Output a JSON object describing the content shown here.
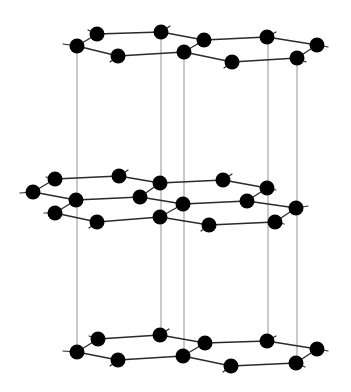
{
  "diagram": {
    "width": 351,
    "height": 392,
    "colors": {
      "background": "#ffffff",
      "atom": "#000000",
      "bond": "#2a2a2a",
      "vertical_line": "#b4b4b4"
    },
    "atom_radius": 7.5,
    "vertical_lines": [
      {
        "x": 77,
        "y1": 46,
        "y2": 352
      },
      {
        "x": 161,
        "y1": 32,
        "y2": 335
      },
      {
        "x": 184,
        "y1": 52,
        "y2": 356
      },
      {
        "x": 268,
        "y1": 37,
        "y2": 341
      },
      {
        "x": 297,
        "y1": 58,
        "y2": 363
      }
    ],
    "layers": [
      {
        "name": "top-layer",
        "atoms": [
          [
            77,
            46
          ],
          [
            97,
            34
          ],
          [
            118,
            56
          ],
          [
            161,
            32
          ],
          [
            184,
            52
          ],
          [
            204,
            40
          ],
          [
            232,
            62
          ],
          [
            267,
            37
          ],
          [
            297,
            58
          ],
          [
            317,
            45
          ]
        ],
        "bonds": [
          [
            0,
            1
          ],
          [
            1,
            3
          ],
          [
            3,
            5
          ],
          [
            5,
            7
          ],
          [
            7,
            9
          ],
          [
            0,
            2
          ],
          [
            2,
            4
          ],
          [
            4,
            6
          ],
          [
            6,
            8
          ],
          [
            8,
            9
          ],
          [
            4,
            5
          ]
        ],
        "stubs": [
          [
            77,
            46,
            63,
            44
          ],
          [
            97,
            34,
            88,
            30
          ],
          [
            118,
            56,
            110,
            62
          ],
          [
            161,
            32,
            170,
            26
          ],
          [
            204,
            40,
            198,
            44
          ],
          [
            232,
            62,
            224,
            68
          ],
          [
            267,
            37,
            276,
            32
          ],
          [
            317,
            45,
            328,
            47
          ],
          [
            297,
            58,
            306,
            62
          ]
        ]
      },
      {
        "name": "middle-layer",
        "atoms": [
          [
            33,
            192
          ],
          [
            55,
            179
          ],
          [
            76,
            200
          ],
          [
            55,
            213
          ],
          [
            119,
            176
          ],
          [
            97,
            222
          ],
          [
            140,
            197
          ],
          [
            160,
            183
          ],
          [
            183,
            204
          ],
          [
            160,
            217
          ],
          [
            223,
            180
          ],
          [
            209,
            225
          ],
          [
            247,
            201
          ],
          [
            267,
            188
          ],
          [
            296,
            208
          ],
          [
            275,
            222
          ]
        ],
        "bonds": [
          [
            1,
            4
          ],
          [
            4,
            7
          ],
          [
            7,
            10
          ],
          [
            10,
            13
          ],
          [
            0,
            1
          ],
          [
            0,
            2
          ],
          [
            2,
            6
          ],
          [
            6,
            8
          ],
          [
            8,
            12
          ],
          [
            12,
            14
          ],
          [
            6,
            7
          ],
          [
            13,
            12
          ],
          [
            2,
            3
          ],
          [
            3,
            5
          ],
          [
            5,
            9
          ],
          [
            9,
            8
          ],
          [
            9,
            11
          ],
          [
            11,
            15
          ],
          [
            15,
            14
          ]
        ],
        "stubs": [
          [
            33,
            192,
            20,
            193
          ],
          [
            55,
            179,
            46,
            177
          ],
          [
            55,
            213,
            44,
            213
          ],
          [
            119,
            176,
            128,
            170
          ],
          [
            97,
            222,
            89,
            228
          ],
          [
            209,
            225,
            201,
            231
          ],
          [
            223,
            180,
            232,
            174
          ],
          [
            267,
            188,
            276,
            190
          ],
          [
            296,
            208,
            308,
            206
          ],
          [
            275,
            222,
            284,
            224
          ]
        ]
      },
      {
        "name": "bottom-layer",
        "atoms": [
          [
            77,
            352
          ],
          [
            98,
            339
          ],
          [
            118,
            360
          ],
          [
            160,
            335
          ],
          [
            183,
            356
          ],
          [
            205,
            343
          ],
          [
            231,
            366
          ],
          [
            267,
            341
          ],
          [
            296,
            363
          ],
          [
            317,
            349
          ]
        ],
        "bonds": [
          [
            0,
            1
          ],
          [
            1,
            3
          ],
          [
            3,
            5
          ],
          [
            5,
            7
          ],
          [
            7,
            9
          ],
          [
            0,
            2
          ],
          [
            2,
            4
          ],
          [
            4,
            6
          ],
          [
            6,
            8
          ],
          [
            8,
            9
          ],
          [
            4,
            5
          ]
        ],
        "stubs": [
          [
            77,
            352,
            63,
            351
          ],
          [
            98,
            339,
            89,
            336
          ],
          [
            118,
            360,
            110,
            366
          ],
          [
            160,
            335,
            169,
            329
          ],
          [
            231,
            366,
            223,
            372
          ],
          [
            267,
            341,
            276,
            336
          ],
          [
            317,
            349,
            328,
            351
          ],
          [
            296,
            363,
            305,
            367
          ]
        ]
      }
    ]
  }
}
